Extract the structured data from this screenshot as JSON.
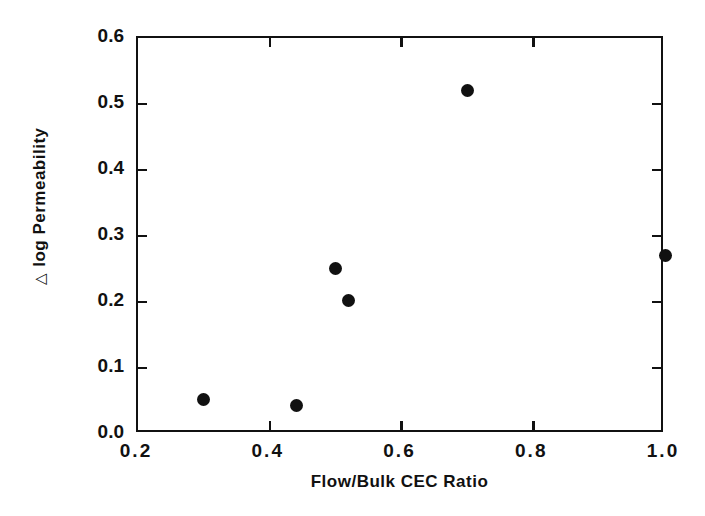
{
  "chart_data": {
    "type": "scatter",
    "title": "",
    "xlabel": "Flow/Bulk  CEC  Ratio",
    "ylabel": "△ log Permeability",
    "xlim": [
      0.2,
      1.0
    ],
    "ylim": [
      0.0,
      0.6
    ],
    "grid": false,
    "legend": null,
    "xticks": [
      0.2,
      0.4,
      0.6,
      0.8,
      1.0
    ],
    "xticklabels": [
      "0.2",
      "0.4",
      "0.6",
      "0.8",
      "1.0"
    ],
    "yticks": [
      0.0,
      0.1,
      0.2,
      0.3,
      0.4,
      0.5,
      0.6
    ],
    "yticklabels": [
      "0.0",
      "0.1",
      "0.2",
      "0.3",
      "0.4",
      "0.5",
      "0.6"
    ],
    "marker": "filled-circle",
    "marker_color": "#111111",
    "points": [
      {
        "x": 0.3,
        "y": 0.052
      },
      {
        "x": 0.44,
        "y": 0.043
      },
      {
        "x": 0.5,
        "y": 0.251
      },
      {
        "x": 0.52,
        "y": 0.202
      },
      {
        "x": 0.7,
        "y": 0.521
      },
      {
        "x": 1.0,
        "y": 0.27
      }
    ]
  },
  "axis": {
    "x_title": "Flow/Bulk  CEC  Ratio",
    "y_title_delta": "△",
    "y_title_text": "log Permeability"
  },
  "colors": {
    "axis": "#111111",
    "marker": "#111111",
    "background": "#ffffff"
  }
}
